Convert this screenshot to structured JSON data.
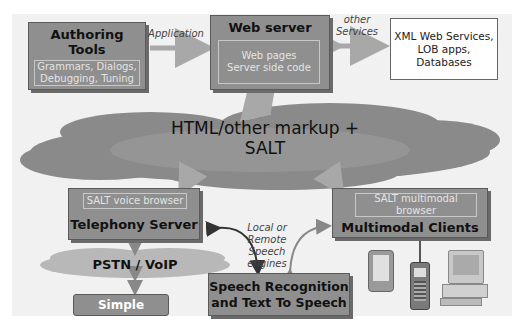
{
  "authoring": {
    "title_line1": "Authoring",
    "title_line2": "Tools",
    "detail_line1": "Grammars, Dialogs,",
    "detail_line2": "Debugging, Tuning"
  },
  "web_server": {
    "title": "Web server",
    "detail_line1": "Web pages",
    "detail_line2": "Server side code"
  },
  "xml_services": {
    "line1": "XML Web Services,",
    "line2": "LOB apps,",
    "line3": "Databases"
  },
  "labels": {
    "application": "Application",
    "other_services_line1": "other",
    "other_services_line2": "Services",
    "speech_engines_line1": "Local or Remote",
    "speech_engines_line2": "Speech",
    "speech_engines_line3": "engines"
  },
  "cloud": {
    "text": "HTML/other markup + SALT"
  },
  "telephony": {
    "browser": "SALT voice browser",
    "title": "Telephony Server"
  },
  "pstn": {
    "text": "PSTN / VoIP"
  },
  "simple_phones": {
    "text": "Simple phones"
  },
  "multimodal": {
    "browser_line1": "SALT multimodal",
    "browser_line2": "browser",
    "title": "Multimodal Clients"
  },
  "speech": {
    "line1": "Speech Recognition",
    "line2": "and Text To Speech"
  },
  "devices": [
    "pda",
    "mobile-phone",
    "desktop-computer"
  ]
}
